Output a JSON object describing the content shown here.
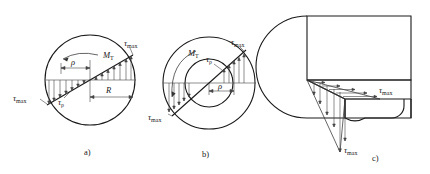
{
  "figure": {
    "stroke_color": "#1a1a1a",
    "background_color": "#ffffff",
    "panels": [
      {
        "id": "a",
        "caption": "a)",
        "description": "Solid circular cross-section with linear shear stress distribution",
        "labels": {
          "torque": "M",
          "torque_sub": "T",
          "tau_max_top": "τ",
          "tau_max_top_sub": "max",
          "tau_max_bottom": "τ",
          "tau_max_bottom_sub": "max",
          "tau_rho": "τ",
          "tau_rho_sub": "ρ",
          "rho": "ρ",
          "radius": "R"
        }
      },
      {
        "id": "b",
        "caption": "b)",
        "description": "Hollow annular cross-section with shear stress distribution between inner and outer radius",
        "labels": {
          "torque": "M",
          "torque_sub": "T",
          "tau_max_top": "τ",
          "tau_max_top_sub": "max",
          "tau_max_bottom": "τ",
          "tau_max_bottom_sub": "max",
          "tau_rho": "τ",
          "tau_rho_sub": "ρ",
          "rho": "ρ"
        }
      },
      {
        "id": "c",
        "caption": "c)",
        "description": "Three dimensional cut-away view of shaft showing shear stress on the sectioned face",
        "labels": {
          "tau_max_right": "τ",
          "tau_max_right_sub": "max",
          "tau_max_bottom": "τ",
          "tau_max_bottom_sub": "max"
        }
      }
    ]
  }
}
